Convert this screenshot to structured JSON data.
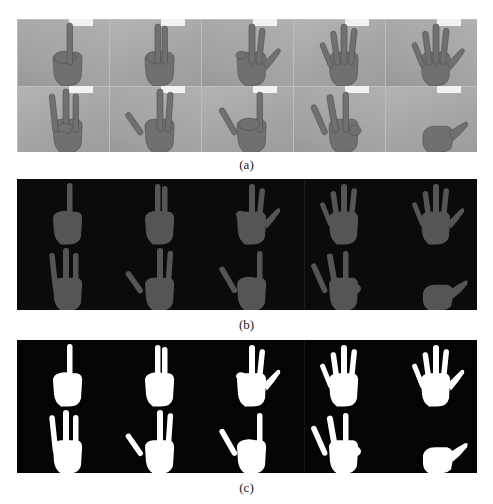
{
  "figure": {
    "panels": [
      {
        "id": "a",
        "caption": "(a)",
        "description": "Original grayscale photographs of hand gestures",
        "rows": 2,
        "cols": 5,
        "style": "photo",
        "background": "#a9a9a9",
        "hand_color": "#6e6e6e"
      },
      {
        "id": "b",
        "caption": "(b)",
        "description": "Skin-segmented hands on dark background",
        "rows": 2,
        "cols": 5,
        "style": "segmented",
        "background": "#0b0b0b",
        "hand_color": "#5a5a5a"
      },
      {
        "id": "c",
        "caption": "(c)",
        "description": "Binary hand masks",
        "rows": 2,
        "cols": 5,
        "style": "binary",
        "background": "#040404",
        "hand_color": "#ffffff"
      }
    ],
    "gestures": [
      {
        "row": 0,
        "col": 0,
        "name": "one"
      },
      {
        "row": 0,
        "col": 1,
        "name": "two"
      },
      {
        "row": 0,
        "col": 2,
        "name": "three-thumb"
      },
      {
        "row": 0,
        "col": 3,
        "name": "four"
      },
      {
        "row": 0,
        "col": 4,
        "name": "five"
      },
      {
        "row": 1,
        "col": 0,
        "name": "three"
      },
      {
        "row": 1,
        "col": 1,
        "name": "three-spread"
      },
      {
        "row": 1,
        "col": 2,
        "name": "horns"
      },
      {
        "row": 1,
        "col": 3,
        "name": "three-index-side"
      },
      {
        "row": 1,
        "col": 4,
        "name": "thumb-out"
      }
    ]
  }
}
